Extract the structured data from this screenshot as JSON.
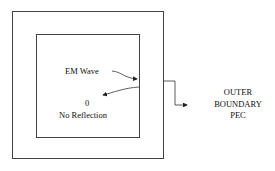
{
  "diagram": {
    "wave_label": "EM Wave",
    "reflection_value": "0",
    "reflection_label": "No Reflection",
    "boundary_label_lines": [
      "OUTER",
      "BOUNDARY",
      "PEC"
    ]
  },
  "colors": {
    "stroke": "#333333",
    "text": "#111111",
    "background": "#ffffff"
  }
}
